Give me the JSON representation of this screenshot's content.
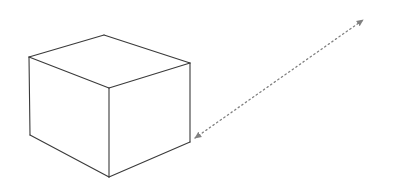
{
  "diagram": {
    "width": 407,
    "height": 187,
    "background": "#ffffff",
    "cube": {
      "stroke": "#3a3a3a",
      "stroke_width": 1.1,
      "vertices": {
        "top_back": [
          104,
          35
        ],
        "top_left": [
          29,
          57
        ],
        "top_right": [
          190,
          63
        ],
        "top_front": [
          109,
          88
        ],
        "bottom_left": [
          30,
          135
        ],
        "bottom_front": [
          109,
          177
        ],
        "bottom_right": [
          190,
          142
        ]
      }
    },
    "arrow": {
      "style": "dotted",
      "double_headed": true,
      "color": "#808080",
      "start": [
        195,
        138
      ],
      "end": [
        363,
        20
      ]
    }
  }
}
